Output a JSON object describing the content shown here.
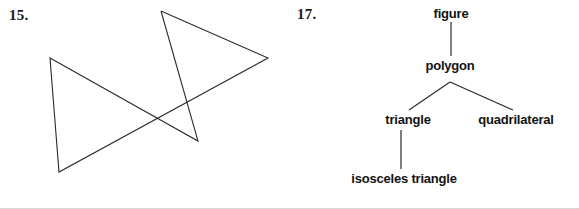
{
  "page": {
    "background_color": "#ffffff",
    "ink_color": "#1a1a1a",
    "width": 579,
    "height": 209
  },
  "exercises": [
    {
      "number_label": "15.",
      "figure_type": "five-pointed-star",
      "description": "Irregular five-pointed star (pentagram) drawn with five straight line segments",
      "stroke_color": "#2b2b2b",
      "stroke_width": 1,
      "vertices": [
        {
          "name": "top-point",
          "x": 161,
          "y": 11
        },
        {
          "name": "right-point",
          "x": 268,
          "y": 58
        },
        {
          "name": "bottom-left-point",
          "x": 59,
          "y": 172
        },
        {
          "name": "left-point",
          "x": 50,
          "y": 58
        },
        {
          "name": "bottom-right-point",
          "x": 198,
          "y": 141
        }
      ],
      "path": "161,11 268,58 59,172 50,58 198,141 161,11"
    },
    {
      "number_label": "17.",
      "figure_type": "hierarchy-tree",
      "description": "Classification tree of geometric figures",
      "stroke_color": "#2b2b2b",
      "stroke_width": 1,
      "nodes": [
        {
          "id": "figure",
          "label": "figure",
          "x": 451,
          "y": 13,
          "level": 0
        },
        {
          "id": "polygon",
          "label": "polygon",
          "x": 450,
          "y": 65,
          "level": 1
        },
        {
          "id": "triangle",
          "label": "triangle",
          "x": 408,
          "y": 120,
          "level": 2
        },
        {
          "id": "quadrilateral",
          "label": "quadrilateral",
          "x": 516,
          "y": 120,
          "level": 2
        },
        {
          "id": "isosceles-triangle",
          "label": "isosceles triangle",
          "x": 404,
          "y": 180,
          "level": 3
        }
      ],
      "edges": [
        {
          "from": "figure",
          "to": "polygon",
          "type": "vertical",
          "x1": 451,
          "y1": 22,
          "x2": 451,
          "y2": 56
        },
        {
          "from": "polygon",
          "to": "triangle",
          "type": "diagonal",
          "x1": 450,
          "y1": 82,
          "x2": 409,
          "y2": 110
        },
        {
          "from": "polygon",
          "to": "quadrilateral",
          "type": "diagonal",
          "x1": 450,
          "y1": 82,
          "x2": 513,
          "y2": 110
        },
        {
          "from": "triangle",
          "to": "isosceles-triangle",
          "type": "vertical",
          "x1": 401,
          "y1": 130,
          "x2": 401,
          "y2": 169
        }
      ]
    }
  ]
}
